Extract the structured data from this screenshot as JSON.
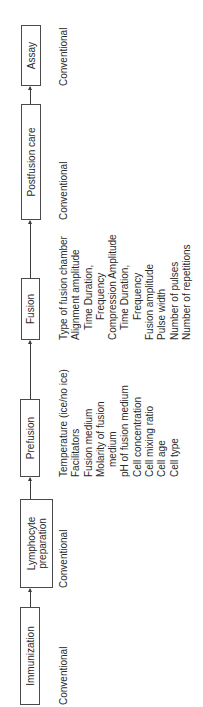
{
  "diagram": {
    "orientation": "rotated 90 degrees counter-clockwise",
    "steps": [
      {
        "id": "immunization",
        "label": "Immunization",
        "parameters": [
          {
            "text": "Conventional",
            "indent": 0
          }
        ]
      },
      {
        "id": "lymphocyte-preparation",
        "label_line1": "Lymphocyte",
        "label_line2": "preparation",
        "parameters": [
          {
            "text": "Conventional",
            "indent": 0
          }
        ]
      },
      {
        "id": "prefusion",
        "label": "Prefusion",
        "parameters": [
          {
            "text": "Temperature (ice/no ice)",
            "indent": 0
          },
          {
            "text": "Facilitators",
            "indent": 0
          },
          {
            "text": "Fusion medium",
            "indent": 0
          },
          {
            "text": "Molarity of fusion",
            "indent": 0
          },
          {
            "text": "medium",
            "indent": 1
          },
          {
            "text": "pH of fusion medium",
            "indent": 0
          },
          {
            "text": "Cell concentration",
            "indent": 0
          },
          {
            "text": "Cell mixing ratio",
            "indent": 0
          },
          {
            "text": "Cell age",
            "indent": 0
          },
          {
            "text": "Cell type",
            "indent": 0
          }
        ]
      },
      {
        "id": "fusion",
        "label": "Fusion",
        "parameters": [
          {
            "text": "Type of fusion chamber",
            "indent": 0
          },
          {
            "text": "Alignment amplitude",
            "indent": 0
          },
          {
            "text": "Time Duration,",
            "indent": 1
          },
          {
            "text": "Frequency",
            "indent": 2
          },
          {
            "text": "Compression Amplitude",
            "indent": 0
          },
          {
            "text": "Time Duration,",
            "indent": 1
          },
          {
            "text": "Frequency",
            "indent": 2
          },
          {
            "text": "Fusion amplitude",
            "indent": 0
          },
          {
            "text": "Pulse width",
            "indent": 0
          },
          {
            "text": "Number of pulses",
            "indent": 0
          },
          {
            "text": "Number of repetitions",
            "indent": 0
          }
        ]
      },
      {
        "id": "postfusion-care",
        "label": "Postfusion care",
        "parameters": [
          {
            "text": "Conventional",
            "indent": 0
          }
        ]
      },
      {
        "id": "assay",
        "label": "Assay",
        "parameters": [
          {
            "text": "Conventional",
            "indent": 0
          }
        ]
      }
    ],
    "connections": [
      [
        "immunization",
        "lymphocyte-preparation"
      ],
      [
        "lymphocyte-preparation",
        "prefusion"
      ],
      [
        "prefusion",
        "fusion"
      ],
      [
        "fusion",
        "postfusion-care"
      ],
      [
        "postfusion-care",
        "assay"
      ]
    ]
  }
}
